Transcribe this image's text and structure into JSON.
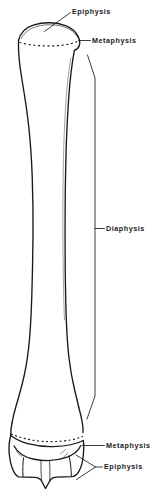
{
  "figure": {
    "background_color": "#ffffff",
    "ink_color": "#1a1a1a"
  },
  "labels": {
    "epiphysis_proximal": "Epiphysis",
    "metaphysis_proximal": "Metaphysis",
    "diaphysis": "Diaphysis",
    "metaphysis_distal": "Metaphysis",
    "epiphysis_distal": "Epiphysis"
  },
  "bone": {
    "orientation": "vertical",
    "regions": [
      {
        "name": "epiphysis",
        "position": "proximal"
      },
      {
        "name": "metaphysis",
        "position": "proximal"
      },
      {
        "name": "diaphysis",
        "position": "middle"
      },
      {
        "name": "metaphysis",
        "position": "distal"
      },
      {
        "name": "epiphysis",
        "position": "distal"
      }
    ],
    "features": [
      "proximal-epiphyseal-plate-dotted",
      "distal-epiphyseal-plate-dotted",
      "distal-condyles",
      "intercondylar-notch"
    ]
  },
  "leaders": {
    "epiphysis_proximal": "diagonal-line",
    "metaphysis_proximal": "horizontal-line",
    "diaphysis": "vertical-bracket",
    "metaphysis_distal": "horizontal-line",
    "epiphysis_distal": "v-bracket"
  }
}
